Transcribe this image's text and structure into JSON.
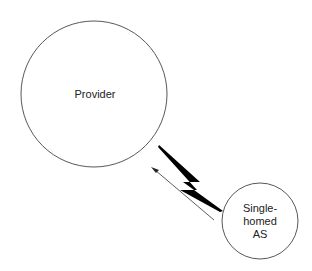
{
  "nodes": {
    "provider": {
      "label": "Provider"
    },
    "single_homed": {
      "line1": "Single-",
      "line2": "homed",
      "line3": "AS"
    }
  },
  "edges": {
    "link": {
      "type": "lightning-bolt"
    },
    "arrow": {
      "direction": "single-homed-to-provider"
    }
  }
}
